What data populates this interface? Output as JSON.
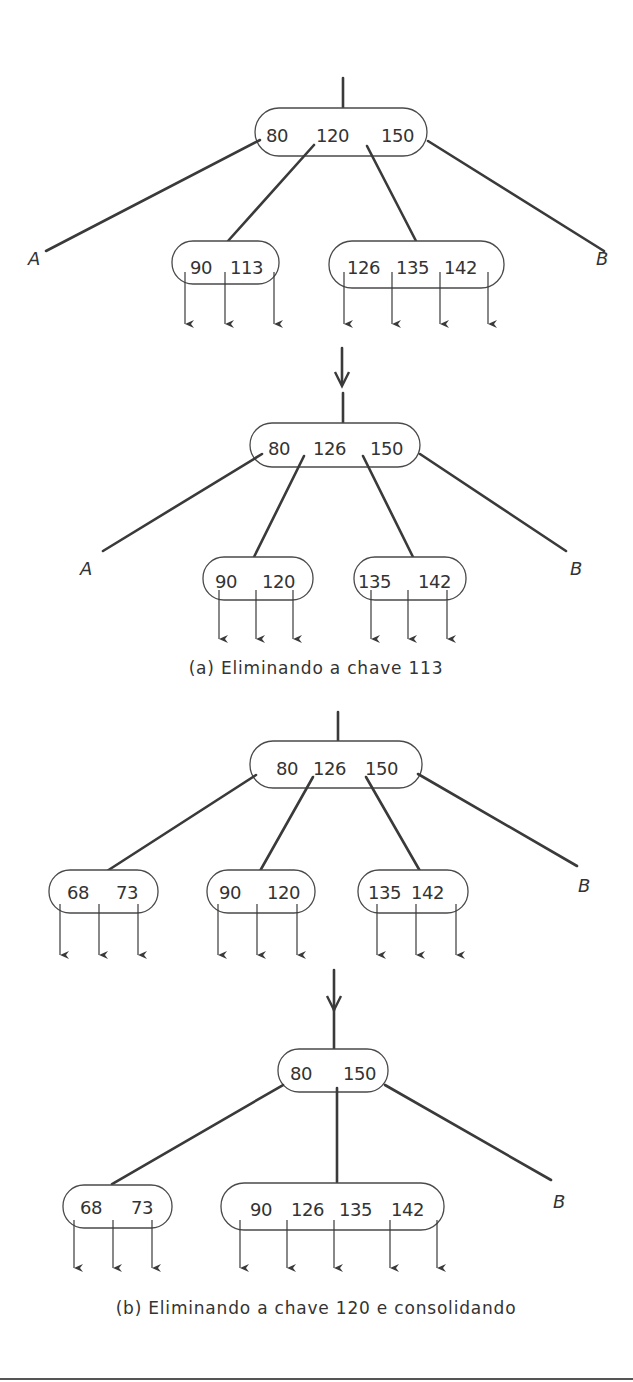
{
  "figure": {
    "part_a": {
      "caption": "(a) Eliminando a chave 113",
      "before": {
        "root": [
          "80",
          "120",
          "150"
        ],
        "left_subtree": "A",
        "right_subtree": "B",
        "children": [
          [
            "90",
            "113"
          ],
          [
            "126",
            "135",
            "142"
          ]
        ]
      },
      "after": {
        "root": [
          "80",
          "126",
          "150"
        ],
        "left_subtree": "A",
        "right_subtree": "B",
        "children": [
          [
            "90",
            "120"
          ],
          [
            "135",
            "142"
          ]
        ]
      }
    },
    "part_b": {
      "caption": "(b) Eliminando a chave 120 e consolidando",
      "before": {
        "root": [
          "80",
          "126",
          "150"
        ],
        "right_subtree": "B",
        "children": [
          [
            "68",
            "73"
          ],
          [
            "90",
            "120"
          ],
          [
            "135",
            "142"
          ]
        ]
      },
      "after": {
        "root": [
          "80",
          "150"
        ],
        "right_subtree": "B",
        "children": [
          [
            "68",
            "73"
          ],
          [
            "90",
            "126",
            "135",
            "142"
          ]
        ]
      }
    }
  },
  "colors": {
    "line": "#3a3a3a",
    "text": "#333333",
    "background": "#ffffff"
  }
}
